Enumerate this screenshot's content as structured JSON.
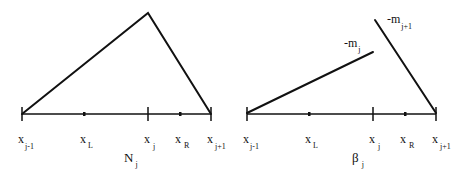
{
  "panels": [
    {
      "id": "left",
      "caption": {
        "base": "N",
        "sub": "j"
      },
      "nodes": [
        {
          "base": "x",
          "sub": "j-1",
          "kind": "tick"
        },
        {
          "base": "x",
          "sub": "L",
          "kind": "dot"
        },
        {
          "base": "x",
          "sub": "j",
          "kind": "tick"
        },
        {
          "base": "x",
          "sub": "R",
          "kind": "dot"
        },
        {
          "base": "x",
          "sub": "j+1",
          "kind": "tick"
        }
      ],
      "shape": "hat function peaking above x_j"
    },
    {
      "id": "right",
      "caption": {
        "base": "β",
        "sub": "j"
      },
      "nodes": [
        {
          "base": "x",
          "sub": "j-1",
          "kind": "tick"
        },
        {
          "base": "x",
          "sub": "L",
          "kind": "dot"
        },
        {
          "base": "x",
          "sub": "j",
          "kind": "tick"
        },
        {
          "base": "x",
          "sub": "R",
          "kind": "dot"
        },
        {
          "base": "x",
          "sub": "j+1",
          "kind": "tick"
        }
      ],
      "segment_labels": [
        {
          "base": "-m",
          "sub": "j"
        },
        {
          "base": "-m",
          "sub": "j+1"
        }
      ],
      "shape": "discontinuous piecewise linear with jump at x_j"
    }
  ]
}
